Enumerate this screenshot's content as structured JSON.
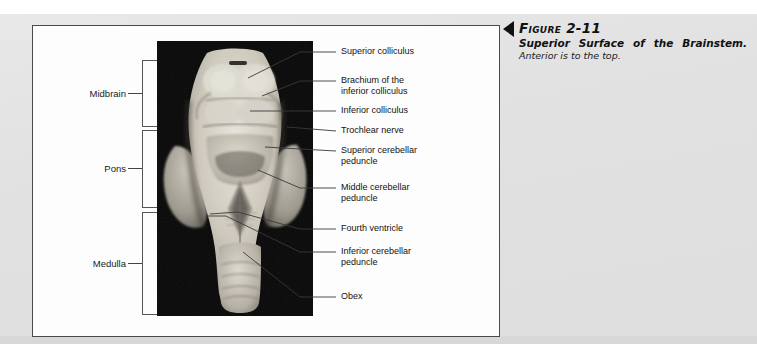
{
  "figure": {
    "number": "Figure 2-11",
    "title": "Superior Surface of the Brainstem.",
    "subtitle": "Anterior is to the top.",
    "marker_icon": "left-triangle-icon"
  },
  "photo": {
    "alt": "Superior surface of a human brainstem specimen on black background",
    "background_color": "#080808"
  },
  "regions": [
    {
      "label": "Midbrain",
      "top": 60,
      "height": 67
    },
    {
      "label": "Pons",
      "top": 130,
      "height": 78
    },
    {
      "label": "Medulla",
      "top": 212,
      "height": 103
    }
  ],
  "callouts": [
    {
      "label_line1": "Superior colliculus",
      "label_line2": "",
      "y": 47,
      "lead_y": 52,
      "tip_x": 248,
      "tip_y": 78
    },
    {
      "label_line1": "Brachium of the",
      "label_line2": "inferior colliculus",
      "y": 76,
      "lead_y": 81,
      "tip_x": 265,
      "tip_y": 94
    },
    {
      "label_line1": "Inferior colliculus",
      "label_line2": "",
      "y": 106,
      "lead_y": 111,
      "tip_x": 248,
      "tip_y": 113
    },
    {
      "label_line1": "Trochlear nerve",
      "label_line2": "",
      "y": 126,
      "lead_y": 131,
      "tip_x": 287,
      "tip_y": 128
    },
    {
      "label_line1": "Superior cerebellar",
      "label_line2": "peduncle",
      "y": 146,
      "lead_y": 151,
      "tip_x": 265,
      "tip_y": 148
    },
    {
      "label_line1": "Middle cerebellar",
      "label_line2": "peduncle",
      "y": 183,
      "lead_y": 188,
      "tip_x": 260,
      "tip_y": 170
    },
    {
      "label_line1": "Fourth ventricle",
      "label_line2": "",
      "y": 224,
      "lead_y": 229,
      "tip_x": 238,
      "tip_y": 213
    },
    {
      "label_line1": "Inferior cerebellar",
      "label_line2": "peduncle",
      "y": 247,
      "lead_y": 252,
      "tip_x": 228,
      "tip_y": 217
    },
    {
      "label_line1": "Obex",
      "label_line2": "",
      "y": 292,
      "lead_y": 297,
      "tip_x": 243,
      "tip_y": 252
    }
  ],
  "colors": {
    "page_background": "#e3e3e3",
    "panel_background": "#fdfdfd",
    "panel_border": "#4a4a4a",
    "text": "#111111",
    "leader_line": "#3a3a3a"
  }
}
